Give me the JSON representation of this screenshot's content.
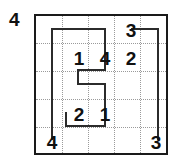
{
  "puzzle": {
    "title": "grid-puzzle",
    "grid": {
      "rows": 5,
      "cols": 5
    },
    "colors": {
      "border": "#1a1a1a",
      "gridline": "#9a9a9a",
      "path": "#2b2b2b",
      "text": "#111111",
      "background": "#ffffff"
    },
    "outside_clues": [
      {
        "name": "outside-clue-topleft",
        "value": "4",
        "position": "top-left"
      }
    ],
    "cells": [
      {
        "row": 1,
        "col": 4,
        "value": "3"
      },
      {
        "row": 2,
        "col": 2,
        "value": "1"
      },
      {
        "row": 2,
        "col": 3,
        "value": "4"
      },
      {
        "row": 2,
        "col": 4,
        "value": "2"
      },
      {
        "row": 4,
        "col": 2,
        "value": "2"
      },
      {
        "row": 4,
        "col": 3,
        "value": "1"
      },
      {
        "row": 5,
        "col": 1,
        "value": "4"
      },
      {
        "row": 5,
        "col": 5,
        "value": "3"
      }
    ],
    "path": {
      "stroke_width": 2,
      "segments": [
        "M52,140 L52,29 L105,29 L105,70 L78,70 L78,84 L105,84 L105,126 L66,126 L66,112",
        "M131,29 L158,29 L158,140"
      ]
    }
  }
}
